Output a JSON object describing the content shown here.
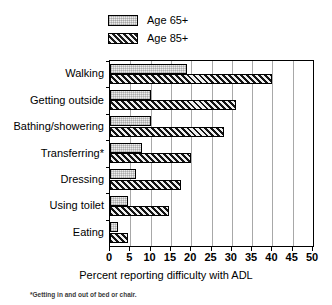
{
  "chart_data": {
    "type": "bar",
    "orientation": "horizontal",
    "title": "",
    "xlabel": "Percent reporting difficulty with ADL",
    "ylabel": "",
    "xlim": [
      0,
      50
    ],
    "xticks": [
      0,
      5,
      10,
      15,
      20,
      25,
      30,
      35,
      40,
      45,
      50
    ],
    "grid": true,
    "legend_position": "top",
    "categories": [
      "Walking",
      "Getting outside",
      "Bathing/showering",
      "Transferring*",
      "Dressing",
      "Using toilet",
      "Eating"
    ],
    "series": [
      {
        "name": "Age 65+",
        "pattern": "light-dotted",
        "color": "#ececec",
        "values": [
          19,
          10,
          10,
          8,
          6.5,
          4.5,
          2
        ]
      },
      {
        "name": "Age 85+",
        "pattern": "dark-diagonal-hatch",
        "color": "#6f6f6f",
        "values": [
          40,
          31,
          28,
          20,
          17.5,
          14.5,
          4.5
        ]
      }
    ],
    "footnote": "*Getting in and out of bed or chair."
  },
  "legend": {
    "items": [
      {
        "label": "Age 65+",
        "swatch": "light-dotted-swatch"
      },
      {
        "label": "Age 85+",
        "swatch": "dark-hatch-swatch"
      }
    ]
  }
}
